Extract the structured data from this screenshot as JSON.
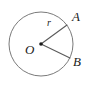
{
  "figure": {
    "kind": "geometry-diagram",
    "background_color": "#ffffff",
    "width": 93,
    "height": 88,
    "stroke_color": "#7a7a7a",
    "radius_stroke_color": "#5a5a5a",
    "label_color": "#1a1a1a",
    "circle": {
      "name": "circle",
      "center_x": 41,
      "center_y": 44,
      "radius": 32,
      "stroke_width": 1
    },
    "center_point": {
      "name": "center-dot",
      "x": 41,
      "y": 44,
      "dot_radius": 1.8
    },
    "radii": [
      {
        "name": "radius-OA",
        "from_x": 41,
        "from_y": 44,
        "to_x": 67,
        "to_y": 25,
        "length_label": "r"
      },
      {
        "name": "radius-OB",
        "from_x": 41,
        "from_y": 44,
        "to_x": 70,
        "to_y": 58,
        "length_label": ""
      }
    ],
    "labels": {
      "point_a": "A",
      "point_b": "B",
      "center": "O",
      "radius": "r"
    }
  }
}
